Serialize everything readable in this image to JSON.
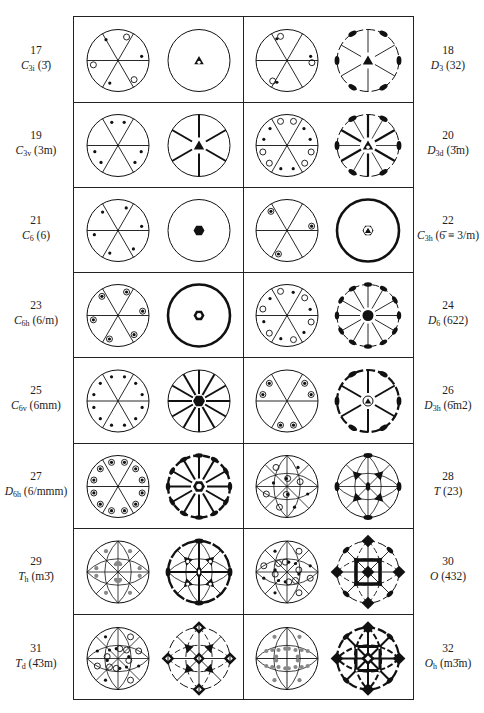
{
  "figure": {
    "title": "",
    "colors": {
      "ink": "#111111",
      "border": "#222222",
      "grey_dot": "#888888",
      "background": "#ffffff"
    }
  },
  "groups": [
    {
      "row": 0,
      "side": "left",
      "number": "17",
      "schoenflies": "C",
      "sub": "3i",
      "hm": "(3̄)",
      "general": "c3i",
      "symmetry": "s3i"
    },
    {
      "row": 0,
      "side": "right",
      "number": "18",
      "schoenflies": "D",
      "sub": "3",
      "hm": "(32)",
      "general": "d3",
      "symmetry": "sd3"
    },
    {
      "row": 1,
      "side": "left",
      "number": "19",
      "schoenflies": "C",
      "sub": "3v",
      "hm": "(3m)",
      "general": "c3v",
      "symmetry": "sc3v"
    },
    {
      "row": 1,
      "side": "right",
      "number": "20",
      "schoenflies": "D",
      "sub": "3d",
      "hm": "(3̄m)",
      "general": "d3d",
      "symmetry": "sd3d"
    },
    {
      "row": 2,
      "side": "left",
      "number": "21",
      "schoenflies": "C",
      "sub": "6",
      "hm": "(6)",
      "general": "c6",
      "symmetry": "sc6"
    },
    {
      "row": 2,
      "side": "right",
      "number": "22",
      "schoenflies": "C",
      "sub": "3h",
      "hm": "(6̄ ≡ 3/m)",
      "general": "c3h",
      "symmetry": "sc3h"
    },
    {
      "row": 3,
      "side": "left",
      "number": "23",
      "schoenflies": "C",
      "sub": "6h",
      "hm": "(6/m)",
      "general": "c6h",
      "symmetry": "sc6h"
    },
    {
      "row": 3,
      "side": "right",
      "number": "24",
      "schoenflies": "D",
      "sub": "6",
      "hm": "(622)",
      "general": "d6",
      "symmetry": "sd6"
    },
    {
      "row": 4,
      "side": "left",
      "number": "25",
      "schoenflies": "C",
      "sub": "6v",
      "hm": "(6mm)",
      "general": "c6v",
      "symmetry": "sc6v"
    },
    {
      "row": 4,
      "side": "right",
      "number": "26",
      "schoenflies": "D",
      "sub": "3h",
      "hm": "(6̄m2)",
      "general": "d3h",
      "symmetry": "sd3h"
    },
    {
      "row": 5,
      "side": "left",
      "number": "27",
      "schoenflies": "D",
      "sub": "6h",
      "hm": "(6/mmm)",
      "general": "d6h",
      "symmetry": "sd6h"
    },
    {
      "row": 5,
      "side": "right",
      "number": "28",
      "schoenflies": "T",
      "sub": "",
      "hm": "(23)",
      "general": "t",
      "symmetry": "st"
    },
    {
      "row": 6,
      "side": "left",
      "number": "29",
      "schoenflies": "T",
      "sub": "h",
      "hm": "(m3̄)",
      "general": "th",
      "symmetry": "sth"
    },
    {
      "row": 6,
      "side": "right",
      "number": "30",
      "schoenflies": "O",
      "sub": "",
      "hm": "(432)",
      "general": "o",
      "symmetry": "so"
    },
    {
      "row": 7,
      "side": "left",
      "number": "31",
      "schoenflies": "T",
      "sub": "d",
      "hm": "(4̄3m)",
      "general": "td",
      "symmetry": "std"
    },
    {
      "row": 7,
      "side": "right",
      "number": "32",
      "schoenflies": "O",
      "sub": "h",
      "hm": "(m3̄m)",
      "general": "oh",
      "symmetry": "soh"
    }
  ],
  "layout": {
    "rows": 8,
    "row_tops": [
      0,
      85,
      170,
      255,
      340,
      426,
      511,
      597
    ],
    "row_height": 86
  }
}
